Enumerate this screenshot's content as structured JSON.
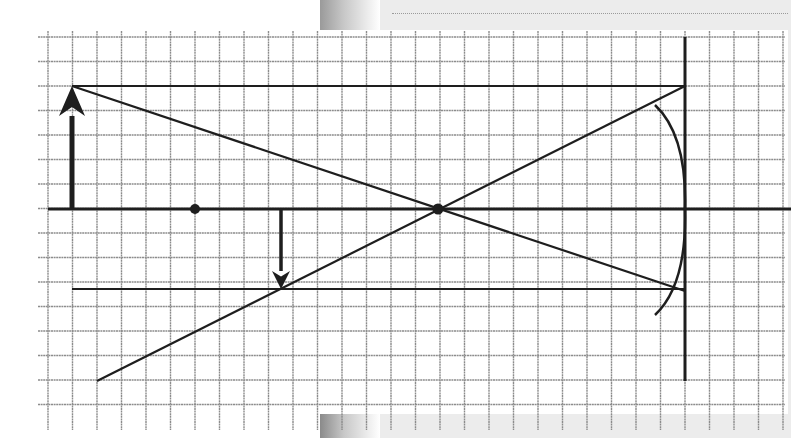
{
  "diagram": {
    "type": "concave-mirror-ray-diagram",
    "colors": {
      "grid_line": "#8c8c8c",
      "ink": "#1e1e1e",
      "paper": "#ffffff",
      "page_bg": "#ececec"
    },
    "grid": {
      "x0": 48,
      "x1": 783,
      "y0": 37,
      "y1": 405,
      "cell": 24.5,
      "columns": 30,
      "rows": 15
    },
    "principal_axis": {
      "y": 209,
      "x_start": 48,
      "x_end": 791
    },
    "mirror": {
      "vertex_line_x": 685,
      "vertex_line_y_top": 37,
      "vertex_line_y_bottom": 381,
      "arc_top": [
        655,
        105
      ],
      "arc_vertex": [
        685,
        209
      ],
      "arc_bottom": [
        655,
        315
      ]
    },
    "points": {
      "focal_point": {
        "label": "F",
        "x": 195,
        "y": 209
      },
      "center_of_curvature": {
        "label": "C",
        "x": 438,
        "y": 209
      }
    },
    "object_arrow": {
      "label": "object",
      "x": 72,
      "y_base": 209,
      "y_tip": 86,
      "direction": "up"
    },
    "image_arrow": {
      "label": "image",
      "x": 281,
      "y_base": 209,
      "y_tip": 289,
      "direction": "down"
    },
    "rays": [
      {
        "name": "top-parallel-ray",
        "from": [
          72,
          86
        ],
        "to": [
          685,
          86
        ]
      },
      {
        "name": "object-through-center-ray",
        "from": [
          72,
          86
        ],
        "to": [
          685,
          291
        ]
      },
      {
        "name": "reflected-through-center-ray",
        "from": [
          685,
          86
        ],
        "to": [
          97,
          381
        ]
      },
      {
        "name": "bottom-parallel-ray",
        "from": [
          72,
          289
        ],
        "to": [
          685,
          289
        ]
      }
    ]
  }
}
